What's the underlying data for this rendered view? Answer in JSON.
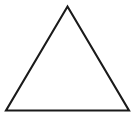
{
  "figure": {
    "type": "geometric-shape",
    "shape_name": "triangle",
    "shape_kind": "isosceles-triangle",
    "background_color": "#ffffff",
    "canvas": {
      "width": 136,
      "height": 123
    },
    "stroke": {
      "color": "#1a1a1a",
      "width": 2.1,
      "linejoin": "miter",
      "linecap": "butt"
    },
    "fill": "none",
    "vertices": [
      {
        "name": "apex",
        "x": 67.5,
        "y": 6.5
      },
      {
        "name": "bottom-right",
        "x": 129.0,
        "y": 110.5
      },
      {
        "name": "bottom-left",
        "x": 6.0,
        "y": 110.5
      }
    ],
    "points_attr": "67.5,6.5 129,110.5 6,110.5",
    "edges": [
      {
        "name": "left-edge",
        "from": "apex",
        "to": "bottom-left"
      },
      {
        "name": "right-edge",
        "from": "apex",
        "to": "bottom-right"
      },
      {
        "name": "base-edge",
        "from": "bottom-left",
        "to": "bottom-right"
      }
    ],
    "labels": [],
    "annotations": []
  }
}
